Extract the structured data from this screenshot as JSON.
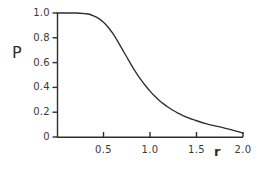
{
  "chart_data": {
    "type": "line",
    "title": "",
    "subtitle": "",
    "xlabel": "r",
    "ylabel": "P",
    "xlim": [
      0.0,
      2.0
    ],
    "ylim": [
      0.0,
      1.0
    ],
    "grid": false,
    "legend": null,
    "xticks": [
      0.5,
      1.0,
      1.5,
      2.0
    ],
    "xtick_labels": [
      "0.5",
      "1.0",
      "1.5",
      "2.0"
    ],
    "yticks": [
      0.0,
      0.2,
      0.4,
      0.6,
      0.8,
      1.0
    ],
    "ytick_labels": [
      "0",
      "0.2",
      "0.4",
      "0.6",
      "0.8",
      "1.0"
    ],
    "line_color": "#2e2e2e",
    "axis_color": "#2e2e2e",
    "series": [
      {
        "name": "P(r)",
        "x": [
          0.0,
          0.1,
          0.2,
          0.3,
          0.35,
          0.4,
          0.45,
          0.5,
          0.55,
          0.6,
          0.65,
          0.7,
          0.75,
          0.8,
          0.85,
          0.9,
          0.95,
          1.0,
          1.05,
          1.1,
          1.15,
          1.2,
          1.25,
          1.3,
          1.35,
          1.4,
          1.45,
          1.5,
          1.55,
          1.6,
          1.65,
          1.7,
          1.75,
          1.8,
          1.85,
          1.9,
          1.95,
          2.0
        ],
        "y": [
          1.0,
          1.0,
          1.0,
          0.995,
          0.99,
          0.975,
          0.955,
          0.925,
          0.885,
          0.835,
          0.775,
          0.71,
          0.645,
          0.58,
          0.52,
          0.465,
          0.415,
          0.37,
          0.33,
          0.295,
          0.265,
          0.238,
          0.214,
          0.193,
          0.175,
          0.158,
          0.144,
          0.131,
          0.119,
          0.108,
          0.098,
          0.089,
          0.081,
          0.072,
          0.063,
          0.053,
          0.043,
          0.03
        ]
      }
    ]
  },
  "axes": {
    "y_title": "P",
    "x_title": "r"
  },
  "geometry": {
    "plot_left": 57,
    "plot_right": 243,
    "plot_top": 13,
    "plot_bottom": 137
  }
}
